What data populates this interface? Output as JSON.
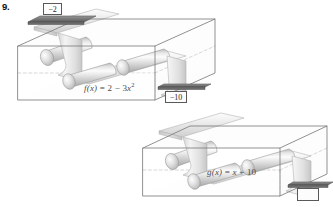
{
  "problem": {
    "number": "9."
  },
  "machines": [
    {
      "id": "upper",
      "equation_label": "f(x) = 2 − 3x²",
      "equation_parts": {
        "function_name": "f",
        "variable": "(x)",
        "equals": " = ",
        "constant": "2",
        "operator": " − ",
        "coefficient": "3",
        "term_variable": "x",
        "exponent": "2"
      },
      "input_label": "−2",
      "output_label": "−10"
    },
    {
      "id": "lower",
      "equation_label": "g(x) = x + 10",
      "equation_parts": {
        "function_name": "g",
        "variable": "(x)",
        "equals": " = ",
        "term_variable": "x",
        "operator": " + ",
        "constant": "10"
      },
      "input_label": "−10",
      "output_label": ""
    }
  ],
  "boxes": {
    "input_value": "−2",
    "intermediate_value": "−10",
    "output_value": ""
  },
  "colors": {
    "background": "#ffffff",
    "outline": "#7a7a7a",
    "hidden_edge": "#a8a8a8",
    "belt_light": "#f2f2f2",
    "belt_mid": "#dcdcdc",
    "belt_dark": "#bdbdbd",
    "roller_light": "#fafafa",
    "roller_mid": "#d4d4d4",
    "roller_dark": "#a9a9a9",
    "label_text": "#4c4c4c",
    "box_border": "#595959",
    "number_text": "#111111"
  },
  "diagram": {
    "type": "function-machine-composition"
  }
}
